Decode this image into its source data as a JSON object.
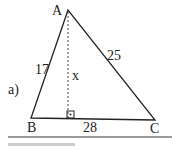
{
  "diagram": {
    "part_label": "a)",
    "vertices": {
      "A": "A",
      "B": "B",
      "C": "C"
    },
    "sides": {
      "AB": "17",
      "AC": "25",
      "BC": "28"
    },
    "altitude_label": "x",
    "right_angle_marker": "right-angle"
  }
}
